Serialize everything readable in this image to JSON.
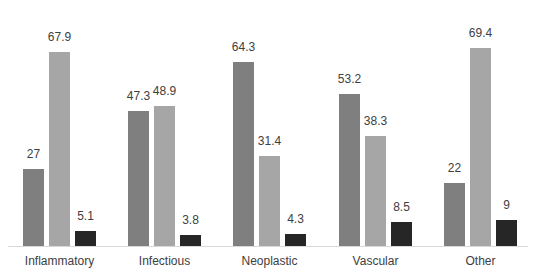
{
  "chart_data": {
    "type": "bar",
    "title": "",
    "xlabel": "",
    "ylabel": "",
    "categories": [
      "Inflammatory",
      "Infectious",
      "Neoplastic",
      "Vascular",
      "Other"
    ],
    "series": [
      {
        "name": "Series 1",
        "color": "#7f7f7f",
        "values": [
          27,
          47.3,
          64.3,
          53.2,
          22
        ]
      },
      {
        "name": "Series 2",
        "color": "#a6a6a6",
        "values": [
          67.9,
          48.9,
          31.4,
          38.3,
          69.4
        ]
      },
      {
        "name": "Series 3",
        "color": "#262626",
        "values": [
          5.1,
          3.8,
          4.3,
          8.5,
          9
        ]
      }
    ],
    "ylim": [
      0,
      80
    ],
    "grid": false,
    "legend": "none",
    "data_labels": true
  }
}
